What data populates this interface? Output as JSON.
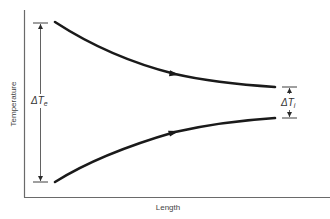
{
  "diagram": {
    "x_axis_label": "Length",
    "y_axis_label": "Temperature",
    "left_dimension": {
      "symbol": "ΔT",
      "subscript": "e"
    },
    "right_dimension": {
      "symbol": "ΔT",
      "subscript": "i"
    },
    "curves": [
      {
        "name": "upper-curve",
        "direction": "decreasing",
        "arrow": "right"
      },
      {
        "name": "lower-curve",
        "direction": "increasing",
        "arrow": "right"
      }
    ],
    "colors": {
      "curve": "#1a1a1a",
      "axis": "#6a6a6a",
      "text": "#333333"
    }
  }
}
